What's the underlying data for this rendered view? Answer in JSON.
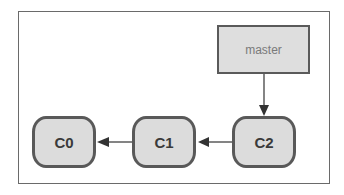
{
  "diagram": {
    "type": "git-commit-graph",
    "branch": {
      "label": "master",
      "points_to": "C2"
    },
    "commits": [
      {
        "id": "C0",
        "label": "C0",
        "parent": null
      },
      {
        "id": "C1",
        "label": "C1",
        "parent": "C0"
      },
      {
        "id": "C2",
        "label": "C2",
        "parent": "C1"
      }
    ],
    "edges": [
      {
        "from": "master",
        "to": "C2"
      },
      {
        "from": "C2",
        "to": "C1"
      },
      {
        "from": "C1",
        "to": "C0"
      }
    ],
    "colors": {
      "node_fill": "#dcdcdc",
      "node_border": "#595959",
      "frame_border": "#6a6a6a",
      "text": "#3a3a3a",
      "branch_text": "#7a7a7a",
      "arrow": "#333333"
    }
  }
}
